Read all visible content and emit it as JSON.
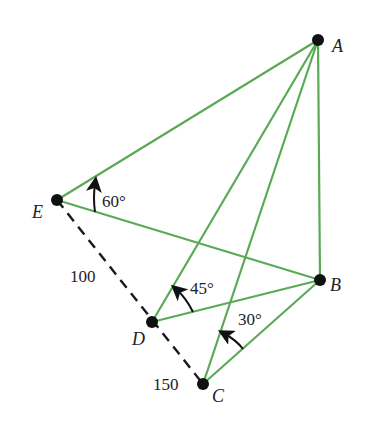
{
  "diagram": {
    "colors": {
      "edge": "#5aaa55",
      "dashed": "#1a1a1a",
      "point": "#111111"
    },
    "points": {
      "A": {
        "label": "A",
        "x": 318,
        "y": 40
      },
      "B": {
        "label": "B",
        "x": 320,
        "y": 280
      },
      "C": {
        "label": "C",
        "x": 203,
        "y": 384
      },
      "D": {
        "label": "D",
        "x": 152,
        "y": 322
      },
      "E": {
        "label": "E",
        "x": 57,
        "y": 200
      }
    },
    "edges": [
      [
        "A",
        "E"
      ],
      [
        "A",
        "D"
      ],
      [
        "A",
        "C"
      ],
      [
        "A",
        "B"
      ],
      [
        "E",
        "B"
      ],
      [
        "D",
        "B"
      ],
      [
        "C",
        "B"
      ]
    ],
    "dashed": [
      [
        "E",
        "C"
      ]
    ],
    "angles": [
      {
        "label": "60°",
        "at": "E"
      },
      {
        "label": "45°",
        "at": "D"
      },
      {
        "label": "30°",
        "at": "C"
      }
    ],
    "distances": [
      {
        "label": "100",
        "segment": "E-D"
      },
      {
        "label": "150",
        "segment": "D-C"
      }
    ]
  }
}
